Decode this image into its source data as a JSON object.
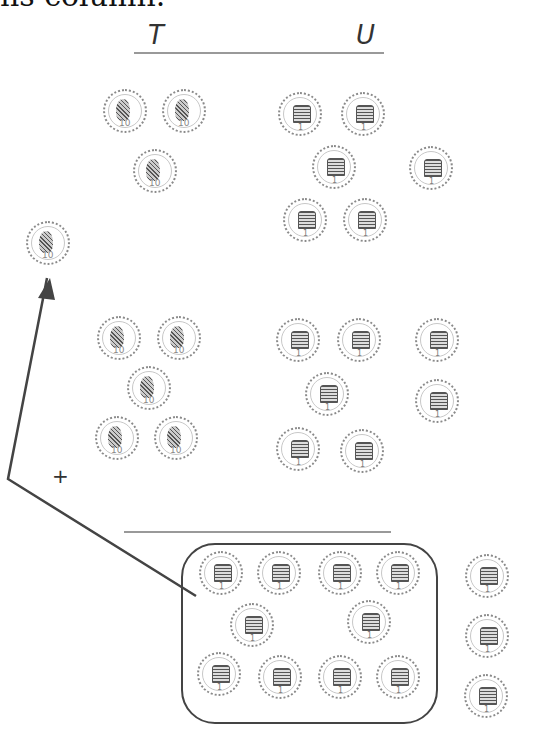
{
  "header_text_fragment": "ns column.",
  "columns": {
    "tens_label": "T",
    "units_label": "U"
  },
  "operator": "+",
  "coins": {
    "ten_label": "10",
    "one_label": "1",
    "row1": {
      "tens": 3,
      "units": 7
    },
    "carried_ten": 1,
    "row2": {
      "tens": 5,
      "units": 8
    },
    "result": {
      "units_grouped": 10,
      "units_remaining": 3
    }
  },
  "colors": {
    "line": "#444444",
    "rule": "#999999",
    "coin_border": "#8a8a8a"
  }
}
